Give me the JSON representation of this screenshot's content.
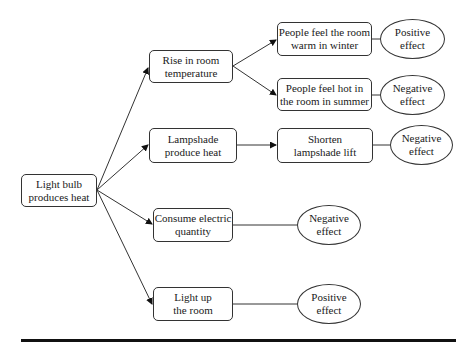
{
  "diagram": {
    "root": {
      "line1": "Light bulb",
      "line2": "produces heat"
    },
    "branches": [
      {
        "line1": "Rise in room",
        "line2": "temperature"
      },
      {
        "line1": "Lampshade",
        "line2": "produce heat"
      },
      {
        "line1": "Consume electric",
        "line2": "quantity"
      },
      {
        "line1": "Light up",
        "line2": "the room"
      }
    ],
    "consequences": [
      {
        "line1": "People feel the room",
        "line2": "warm in winter"
      },
      {
        "line1": "People feel hot in",
        "line2": "the room in summer"
      },
      {
        "line1": "Shorten",
        "line2": "lampshade lift"
      }
    ],
    "effects": [
      {
        "line1": "Positive",
        "line2": "effect"
      },
      {
        "line1": "Negative",
        "line2": "effect"
      },
      {
        "line1": "Negative",
        "line2": "effect"
      },
      {
        "line1": "Negative",
        "line2": "effect"
      },
      {
        "line1": "Positive",
        "line2": "effect"
      }
    ]
  }
}
